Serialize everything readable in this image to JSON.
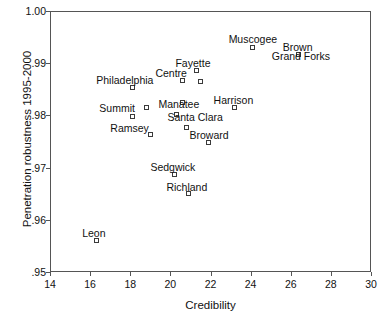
{
  "chart_data": {
    "type": "scatter",
    "title": "",
    "xlabel": "Credibility",
    "ylabel": "Penetration robustness 1995-2000",
    "xlim": [
      14,
      30
    ],
    "ylim": [
      0.95,
      1.0
    ],
    "xticks": [
      "14",
      "16",
      "18",
      "20",
      "22",
      "24",
      "26",
      "28",
      "30"
    ],
    "xtick_values": [
      14,
      16,
      18,
      20,
      22,
      24,
      26,
      28,
      30
    ],
    "yticks": [
      "1.00",
      ".99",
      ".98",
      ".97",
      ".96",
      ".95"
    ],
    "ytick_values": [
      1.0,
      0.99,
      0.98,
      0.97,
      0.96,
      0.95
    ],
    "grid": false,
    "legend": null,
    "marker_style": "open-square",
    "points": [
      {
        "label": "Philadelphia",
        "x": 18.1,
        "y": 0.9853,
        "label_dx": -36,
        "label_dy": -13
      },
      {
        "label": "Summit",
        "x": 18.8,
        "y": 0.9816,
        "label_dx": -47,
        "label_dy": -4
      },
      {
        "label": "",
        "x": 18.1,
        "y": 0.9797,
        "label_dx": 0,
        "label_dy": 0
      },
      {
        "label": "Ramsey",
        "x": 19.0,
        "y": 0.9763,
        "label_dx": -40,
        "label_dy": -12
      },
      {
        "label": "Manatee",
        "x": 20.6,
        "y": 0.9824,
        "label_dx": -24,
        "label_dy": -4
      },
      {
        "label": "Santa Clara",
        "x": 20.3,
        "y": 0.9801,
        "label_dx": -9,
        "label_dy": -3
      },
      {
        "label": "",
        "x": 20.8,
        "y": 0.9777,
        "label_dx": 0,
        "label_dy": 0
      },
      {
        "label": "Centre",
        "x": 20.6,
        "y": 0.9866,
        "label_dx": -27,
        "label_dy": -13
      },
      {
        "label": "Fayette",
        "x": 21.3,
        "y": 0.9886,
        "label_dx": -21,
        "label_dy": -13
      },
      {
        "label": "",
        "x": 21.5,
        "y": 0.9864,
        "label_dx": 0,
        "label_dy": 0
      },
      {
        "label": "Broward",
        "x": 21.9,
        "y": 0.9749,
        "label_dx": -19,
        "label_dy": -12
      },
      {
        "label": "Harrison",
        "x": 23.2,
        "y": 0.9815,
        "label_dx": -21,
        "label_dy": -13
      },
      {
        "label": "Muscogee",
        "x": 24.1,
        "y": 0.9931,
        "label_dx": -24,
        "label_dy": -13
      },
      {
        "label": "Brown",
        "x": 26.4,
        "y": 0.9916,
        "label_dx": -16,
        "label_dy": -13
      },
      {
        "label": "Grand Forks",
        "x": 26.4,
        "y": 0.9916,
        "label_dx": -27,
        "label_dy": -4
      },
      {
        "label": "Sedgwick",
        "x": 20.2,
        "y": 0.9686,
        "label_dx": -24,
        "label_dy": -13
      },
      {
        "label": "Richland",
        "x": 20.9,
        "y": 0.965,
        "label_dx": -22,
        "label_dy": -12
      },
      {
        "label": "Leon",
        "x": 16.3,
        "y": 0.9561,
        "label_dx": -14,
        "label_dy": -12
      }
    ]
  },
  "axes": {
    "x_title": "Credibility",
    "y_title": "Penetration robustness 1995-2000"
  }
}
